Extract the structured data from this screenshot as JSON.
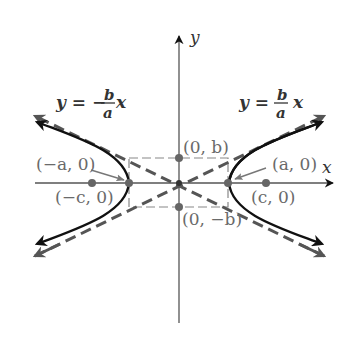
{
  "diagram": {
    "type": "hyperbola",
    "orientation": "horizontal",
    "axes": {
      "x_label": "x",
      "y_label": "y"
    },
    "asymptotes": {
      "negative": {
        "lhs": "y = −",
        "frac_num": "b",
        "frac_den": "a",
        "var": "x"
      },
      "positive": {
        "lhs": "y =",
        "frac_num": "b",
        "frac_den": "a",
        "var": "x"
      }
    },
    "points": {
      "left_vertex": "(−a, 0)",
      "right_vertex": "(a, 0)",
      "left_focus": "(−c, 0)",
      "right_focus": "(c, 0)",
      "top_covertex": "(0, b)",
      "bottom_covertex": "(0, −b)"
    },
    "colors": {
      "curve": "#111111",
      "asymptote": "#555555",
      "axis": "#555555",
      "rectangle": "#777777",
      "point": "#666666",
      "label": "#6a6a6a",
      "equation": "#333333"
    }
  }
}
